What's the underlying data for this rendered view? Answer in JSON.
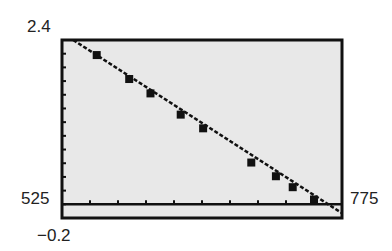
{
  "chart_data": {
    "type": "scatter",
    "title": "",
    "xlabel": "",
    "ylabel": "",
    "xlim": [
      525,
      775
    ],
    "ylim": [
      -0.2,
      2.4
    ],
    "tick_labels": {
      "ymax": "2.4",
      "ymin": "−0.2",
      "xmin": "525",
      "xmax": "775"
    },
    "grid": false,
    "series": [
      {
        "name": "data points",
        "style": "square-markers",
        "x": [
          556,
          585,
          604,
          631,
          651,
          694,
          716,
          731,
          750
        ],
        "y": [
          2.18,
          1.83,
          1.62,
          1.31,
          1.11,
          0.61,
          0.41,
          0.25,
          0.07
        ]
      },
      {
        "name": "regression line",
        "style": "dotted-line",
        "x": [
          535,
          775
        ],
        "y": [
          2.4,
          -0.13
        ]
      }
    ],
    "x_axis_line_y": 0,
    "background": "#e8e8e8"
  }
}
